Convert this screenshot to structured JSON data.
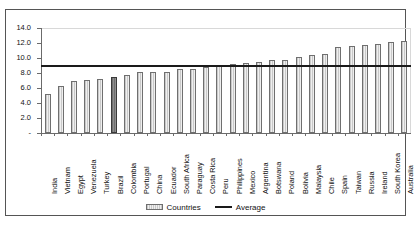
{
  "chart_data": {
    "type": "bar",
    "title": "",
    "xlabel": "",
    "ylabel": "",
    "ylim": [
      0,
      14
    ],
    "yticks": [
      0,
      2,
      4,
      6,
      8,
      10,
      12,
      14
    ],
    "ytick_labels": [
      "-",
      "2.0",
      "4.0",
      "6.0",
      "8.0",
      "10.0",
      "12.0",
      "14.0"
    ],
    "grid": false,
    "legend_position": "bottom",
    "categories": [
      "India",
      "Vietnam",
      "Egypt",
      "Venezuela",
      "Turkey",
      "Brazil",
      "Colombia",
      "Portugal",
      "China",
      "Ecuador",
      "South Africa",
      "Paraguay",
      "Costa Rica",
      "Peru",
      "Philippines",
      "Mexico",
      "Argentina",
      "Botswana",
      "Poland",
      "Bolivia",
      "Malaysia",
      "Chile",
      "Spain",
      "Taiwan",
      "Russia",
      "Ireland",
      "South Korea",
      "Australia"
    ],
    "values": [
      5.2,
      6.3,
      6.9,
      7.1,
      7.2,
      7.5,
      7.8,
      8.1,
      8.2,
      8.2,
      8.5,
      8.6,
      8.8,
      8.9,
      9.2,
      9.3,
      9.5,
      9.7,
      9.8,
      10.2,
      10.4,
      10.6,
      11.5,
      11.6,
      11.7,
      11.9,
      12.1,
      12.3
    ],
    "highlight_category": "Brazil",
    "series": [
      {
        "name": "Countries",
        "type": "bar"
      },
      {
        "name": "Average",
        "type": "line",
        "value": 9.0
      }
    ],
    "average_value": 9.0
  },
  "legend": {
    "countries_label": "Countries",
    "average_label": "Average"
  },
  "colors": {
    "bar_fill": "#dcdcdc",
    "bar_border": "#6f6f6f",
    "highlight_fill": "#7e7e7e",
    "average_line": "#1a1a1a",
    "axis": "#6b6b6b",
    "frame": "#555555"
  }
}
